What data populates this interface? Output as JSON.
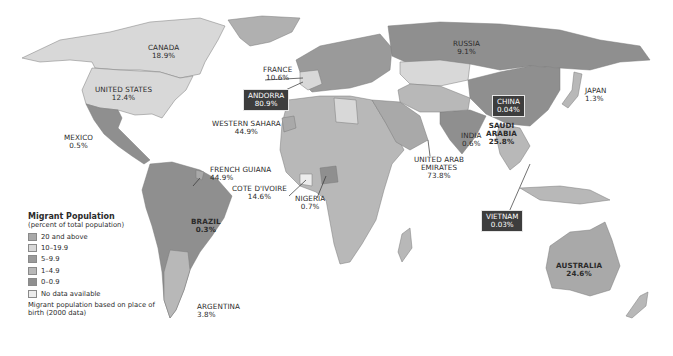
{
  "legend": {
    "title": "Migrant Population",
    "subtitle": "(percent of total population)",
    "items": [
      {
        "label": "20 and above",
        "color": "#a9a9a9"
      },
      {
        "label": "10–19.9",
        "color": "#d8d8d8"
      },
      {
        "label": "5–9.9",
        "color": "#9a9a9a"
      },
      {
        "label": "1–4.9",
        "color": "#b8b8b8"
      },
      {
        "label": "0–0.9",
        "color": "#8f8f8f"
      },
      {
        "label": "No data available",
        "color": "#ececec"
      }
    ],
    "note": "Migrant population based on place of birth (2000 data)"
  },
  "countries": [
    {
      "name": "CANADA",
      "value": "18.9%"
    },
    {
      "name": "UNITED STATES",
      "value": "12.4%"
    },
    {
      "name": "MEXICO",
      "value": "0.5%"
    },
    {
      "name": "FRENCH GUIANA",
      "value": "44.9%"
    },
    {
      "name": "BRAZIL",
      "value": "0.3%"
    },
    {
      "name": "ARGENTINA",
      "value": "3.8%"
    },
    {
      "name": "FRANCE",
      "value": "10.6%"
    },
    {
      "name": "ANDORRA",
      "value": "80.9%"
    },
    {
      "name": "WESTERN SAHARA",
      "value": "44.9%"
    },
    {
      "name": "COTE D'IVOIRE",
      "value": "14.6%"
    },
    {
      "name": "NIGERIA",
      "value": "0.7%"
    },
    {
      "name": "SAUDI ARABIA",
      "value": "25.8%"
    },
    {
      "name": "UNITED ARAB EMIRATES",
      "value": "73.8%"
    },
    {
      "name": "INDIA",
      "value": "0.6%"
    },
    {
      "name": "RUSSIA",
      "value": "9.1%"
    },
    {
      "name": "CHINA",
      "value": "0.04%"
    },
    {
      "name": "JAPAN",
      "value": "1.3%"
    },
    {
      "name": "VIETNAM",
      "value": "0.03%"
    },
    {
      "name": "AUSTRALIA",
      "value": "24.6%"
    }
  ],
  "label_parts": {
    "saudi_1": "SAUDI",
    "saudi_2": "ARABIA",
    "uae_1": "UNITED ARAB",
    "uae_2": "EMIRATES"
  },
  "colors": {
    "ocean": "#ffffff",
    "callout_box": "#3d3d3d",
    "border": "#6e6e6e"
  }
}
